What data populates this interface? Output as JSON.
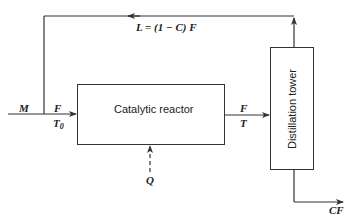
{
  "diagram": {
    "type": "process-flow",
    "colors": {
      "line": "#333333",
      "text": "#222222",
      "background": "#ffffff"
    },
    "nodes": {
      "reactor": {
        "label": "Catalytic reactor"
      },
      "tower": {
        "label": "Distillation tower"
      }
    },
    "streams": {
      "makeup": {
        "label": "M"
      },
      "reactor_feed": {
        "flow": "F",
        "temp": "T",
        "temp_sub": "0"
      },
      "reactor_out": {
        "flow": "F",
        "temp": "T"
      },
      "recycle": {
        "label": "L = (1 − C) F"
      },
      "product": {
        "label": "CF"
      },
      "heat": {
        "label": "Q"
      }
    }
  }
}
